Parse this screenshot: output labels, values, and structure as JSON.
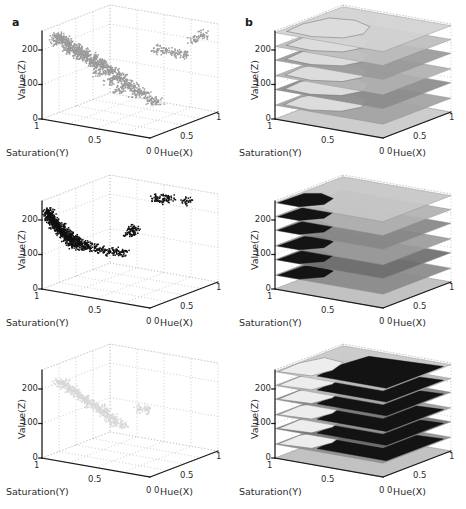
{
  "figure": {
    "width": 466,
    "height": 509,
    "background": "#ffffff",
    "panel_labels": [
      "a",
      "b"
    ],
    "rows": 3,
    "cols": 2
  },
  "axes": {
    "z": {
      "label": "Value(Z)",
      "ticks": [
        "0",
        "100",
        "200"
      ],
      "tick_values": [
        0,
        100,
        200
      ],
      "range": [
        0,
        255
      ]
    },
    "y": {
      "label": "Saturation(Y)",
      "ticks": [
        "1",
        "0.5",
        "0"
      ],
      "tick_values": [
        1,
        0.5,
        0
      ],
      "range": [
        0,
        1
      ]
    },
    "x": {
      "label": "Hue(X)",
      "ticks": [
        "0",
        "0.5",
        "1"
      ],
      "tick_values": [
        0,
        0.5,
        1
      ],
      "range": [
        0,
        1
      ]
    }
  },
  "colors": {
    "axis_line": "#1a1a1a",
    "grid_dotted": "#b9b9b9",
    "text": "#2b2b2b",
    "cluster_gray": "#9a9a9a",
    "cluster_black": "#111111",
    "cluster_light": "#d8d8d8",
    "plane_light": "#d2d2d2",
    "plane_mid": "#a8a8a8",
    "plane_dark": "#6e6e6e",
    "plane_darker": "#4a4a4a",
    "floor": "#c9c9c9"
  },
  "chart_data": [
    {
      "id": "row1-a",
      "type": "scatter",
      "title": "",
      "panel": "a",
      "row": 1,
      "xlabel": "Hue(X)",
      "ylabel": "Saturation(Y)",
      "zlabel": "Value(Z)",
      "xlim": [
        0,
        1
      ],
      "ylim": [
        0,
        1
      ],
      "zlim": [
        0,
        255
      ],
      "grid": true,
      "legend": "none",
      "point_color": "#9a9a9a",
      "description": "Dense mid-gray point cloud concentrated at low Hue and high Saturation, spanning Value 0-255 with a broad lobe between Value 30 and 240, plus a sparse arm of points extending toward higher Hue near Value 150-190.",
      "points": [
        [
          0.06,
          0.92,
          240
        ],
        [
          0.08,
          0.88,
          235
        ],
        [
          0.1,
          0.95,
          228
        ],
        [
          0.12,
          0.9,
          232
        ],
        [
          0.07,
          0.8,
          215
        ],
        [
          0.09,
          0.76,
          210
        ],
        [
          0.14,
          0.84,
          205
        ],
        [
          0.16,
          0.88,
          200
        ],
        [
          0.05,
          0.7,
          195
        ],
        [
          0.11,
          0.66,
          190
        ],
        [
          0.18,
          0.74,
          186
        ],
        [
          0.2,
          0.8,
          182
        ],
        [
          0.06,
          0.6,
          175
        ],
        [
          0.13,
          0.58,
          170
        ],
        [
          0.22,
          0.7,
          166
        ],
        [
          0.24,
          0.64,
          160
        ],
        [
          0.08,
          0.52,
          155
        ],
        [
          0.15,
          0.48,
          150
        ],
        [
          0.26,
          0.6,
          146
        ],
        [
          0.28,
          0.56,
          140
        ],
        [
          0.1,
          0.44,
          132
        ],
        [
          0.17,
          0.4,
          128
        ],
        [
          0.3,
          0.5,
          122
        ],
        [
          0.32,
          0.46,
          118
        ],
        [
          0.09,
          0.36,
          110
        ],
        [
          0.19,
          0.34,
          105
        ],
        [
          0.34,
          0.42,
          100
        ],
        [
          0.36,
          0.38,
          95
        ],
        [
          0.07,
          0.28,
          86
        ],
        [
          0.21,
          0.26,
          80
        ],
        [
          0.38,
          0.34,
          74
        ],
        [
          0.4,
          0.3,
          68
        ],
        [
          0.12,
          0.2,
          58
        ],
        [
          0.24,
          0.18,
          52
        ],
        [
          0.42,
          0.24,
          46
        ],
        [
          0.44,
          0.2,
          40
        ],
        [
          0.15,
          0.12,
          30
        ],
        [
          0.28,
          0.1,
          24
        ],
        [
          0.46,
          0.14,
          18
        ],
        [
          0.5,
          0.1,
          12
        ],
        [
          0.62,
          0.3,
          185
        ],
        [
          0.68,
          0.26,
          180
        ],
        [
          0.74,
          0.22,
          176
        ],
        [
          0.8,
          0.18,
          172
        ],
        [
          0.86,
          0.14,
          215
        ],
        [
          0.92,
          0.1,
          228
        ]
      ]
    },
    {
      "id": "row1-b",
      "type": "surface",
      "title": "",
      "panel": "b",
      "row": 1,
      "xlabel": "Hue(X)",
      "ylabel": "Saturation(Y)",
      "zlabel": "Value(Z)",
      "xlim": [
        0,
        1
      ],
      "ylim": [
        0,
        1
      ],
      "zlim": [
        0,
        255
      ],
      "grid": true,
      "legend": "none",
      "description": "Same data as row1-a rendered as a stack of semi-transparent gray horizontal slice planes at evenly spaced Value levels with the segmented region drawn on each slice.",
      "slice_levels": [
        0,
        40,
        85,
        125,
        170,
        210,
        250
      ],
      "slice_shades": [
        "#c9c9c9",
        "#a2a2a2",
        "#8c8c8c",
        "#b0b0b0",
        "#9a9a9a",
        "#bdbdbd",
        "#d2d2d2"
      ]
    },
    {
      "id": "row2-a",
      "type": "scatter",
      "title": "",
      "panel": "a",
      "row": 2,
      "xlabel": "Hue(X)",
      "ylabel": "Saturation(Y)",
      "zlabel": "Value(Z)",
      "xlim": [
        0,
        1
      ],
      "ylim": [
        0,
        1
      ],
      "zlim": [
        0,
        255
      ],
      "grid": true,
      "legend": "none",
      "point_color": "#111111",
      "description": "Dense black cluster hugging the Saturation=1 wall between Value 95 and 230, with a thin tail of points fanning toward mid Hue, and a handful of isolated outliers near Hue 0.6-0.85 at Value ~245.",
      "points": [
        [
          0.02,
          0.98,
          228
        ],
        [
          0.03,
          0.96,
          222
        ],
        [
          0.02,
          0.94,
          216
        ],
        [
          0.04,
          0.97,
          210
        ],
        [
          0.03,
          0.92,
          205
        ],
        [
          0.05,
          0.95,
          200
        ],
        [
          0.02,
          0.9,
          196
        ],
        [
          0.06,
          0.93,
          192
        ],
        [
          0.04,
          0.88,
          188
        ],
        [
          0.07,
          0.91,
          184
        ],
        [
          0.03,
          0.86,
          180
        ],
        [
          0.08,
          0.89,
          176
        ],
        [
          0.05,
          0.84,
          172
        ],
        [
          0.1,
          0.87,
          168
        ],
        [
          0.04,
          0.82,
          164
        ],
        [
          0.12,
          0.85,
          160
        ],
        [
          0.06,
          0.8,
          156
        ],
        [
          0.14,
          0.83,
          152
        ],
        [
          0.05,
          0.78,
          148
        ],
        [
          0.16,
          0.8,
          144
        ],
        [
          0.07,
          0.76,
          140
        ],
        [
          0.18,
          0.78,
          136
        ],
        [
          0.06,
          0.74,
          132
        ],
        [
          0.2,
          0.76,
          128
        ],
        [
          0.08,
          0.72,
          124
        ],
        [
          0.24,
          0.72,
          120
        ],
        [
          0.07,
          0.7,
          116
        ],
        [
          0.28,
          0.68,
          114
        ],
        [
          0.09,
          0.66,
          110
        ],
        [
          0.32,
          0.64,
          108
        ],
        [
          0.08,
          0.62,
          104
        ],
        [
          0.36,
          0.6,
          102
        ],
        [
          0.1,
          0.58,
          100
        ],
        [
          0.4,
          0.56,
          100
        ],
        [
          0.12,
          0.54,
          98
        ],
        [
          0.44,
          0.52,
          98
        ],
        [
          0.46,
          0.46,
          150
        ],
        [
          0.48,
          0.44,
          155
        ],
        [
          0.47,
          0.42,
          160
        ],
        [
          0.62,
          0.3,
          246
        ],
        [
          0.66,
          0.28,
          244
        ],
        [
          0.7,
          0.26,
          247
        ],
        [
          0.84,
          0.22,
          246
        ]
      ]
    },
    {
      "id": "row2-b",
      "type": "surface",
      "title": "",
      "panel": "b",
      "row": 2,
      "xlabel": "Hue(X)",
      "ylabel": "Saturation(Y)",
      "zlabel": "Value(Z)",
      "xlim": [
        0,
        1
      ],
      "ylim": [
        0,
        1
      ],
      "zlim": [
        0,
        255
      ],
      "grid": true,
      "legend": "none",
      "description": "Stack of gray slice planes with the black cluster of row2-a intersecting the planes near the Saturation=1 edge between Value 95 and 230.",
      "slice_levels": [
        0,
        40,
        85,
        125,
        170,
        210,
        250
      ],
      "slice_shades": [
        "#bdbdbd",
        "#8a8a8a",
        "#6e6e6e",
        "#9c9c9c",
        "#868686",
        "#b2b2b2",
        "#c6c6c6"
      ]
    },
    {
      "id": "row3-a",
      "type": "scatter",
      "title": "",
      "panel": "a",
      "row": 3,
      "xlabel": "Hue(X)",
      "ylabel": "Saturation(Y)",
      "zlabel": "Value(Z)",
      "xlim": [
        0,
        1
      ],
      "ylim": [
        0,
        1
      ],
      "zlim": [
        0,
        255
      ],
      "grid": true,
      "legend": "none",
      "point_color": "#d8d8d8",
      "description": "Sparse very light-gray cluster occupying low Hue and high Saturation between Value 80 and 225, much fainter and smaller than the other two rows.",
      "points": [
        [
          0.08,
          0.92,
          222
        ],
        [
          0.12,
          0.88,
          215
        ],
        [
          0.1,
          0.84,
          208
        ],
        [
          0.16,
          0.86,
          200
        ],
        [
          0.14,
          0.8,
          192
        ],
        [
          0.2,
          0.82,
          186
        ],
        [
          0.18,
          0.76,
          178
        ],
        [
          0.24,
          0.78,
          170
        ],
        [
          0.22,
          0.72,
          164
        ],
        [
          0.28,
          0.74,
          156
        ],
        [
          0.26,
          0.68,
          148
        ],
        [
          0.32,
          0.7,
          142
        ],
        [
          0.3,
          0.64,
          134
        ],
        [
          0.36,
          0.66,
          128
        ],
        [
          0.34,
          0.6,
          120
        ],
        [
          0.38,
          0.62,
          112
        ],
        [
          0.36,
          0.56,
          104
        ],
        [
          0.4,
          0.58,
          96
        ],
        [
          0.38,
          0.52,
          88
        ],
        [
          0.42,
          0.5,
          82
        ],
        [
          0.52,
          0.4,
          130
        ],
        [
          0.56,
          0.36,
          124
        ]
      ]
    },
    {
      "id": "row3-b",
      "type": "surface",
      "title": "",
      "panel": "b",
      "row": 3,
      "xlabel": "Hue(X)",
      "ylabel": "Saturation(Y)",
      "zlabel": "Value(Z)",
      "xlim": [
        0,
        1
      ],
      "ylim": [
        0,
        1
      ],
      "zlim": [
        0,
        255
      ],
      "grid": true,
      "legend": "none",
      "description": "Stack of gray slice planes showing a bright near-white segmented lobe on the high-Saturation side adjoining a large black region covering the rest of each slice.",
      "slice_levels": [
        0,
        40,
        85,
        125,
        170,
        210,
        250
      ],
      "slice_shades": [
        "#bdbdbd",
        "#8e8e8e",
        "#707070",
        "#9a9a9a",
        "#828282",
        "#b4b4b4",
        "#c8c8c8"
      ]
    }
  ]
}
